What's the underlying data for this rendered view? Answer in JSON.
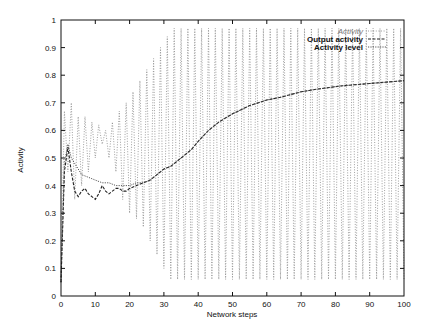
{
  "chart_data": {
    "type": "line",
    "title": "",
    "xlabel": "Network steps",
    "ylabel": "Activity",
    "xlim": [
      0,
      100
    ],
    "ylim": [
      0,
      1
    ],
    "grid": false,
    "legend_position": "upper right (inside)",
    "x_ticks": [
      0,
      10,
      20,
      30,
      40,
      50,
      60,
      70,
      80,
      90,
      100
    ],
    "y_ticks": [
      0,
      0.1,
      0.2,
      0.3,
      0.4,
      0.5,
      0.6,
      0.7,
      0.8,
      0.9,
      1
    ],
    "x_tick_labels": [
      "0",
      "10",
      "20",
      "30",
      "40",
      "50",
      "60",
      "70",
      "80",
      "90",
      "100"
    ],
    "y_tick_labels": [
      "0",
      "0.1",
      "0.2",
      "0.3",
      "0.4",
      "0.5",
      "0.6",
      "0.7",
      "0.8",
      "0.9",
      "1"
    ],
    "series": [
      {
        "name": "Activity",
        "style": "fine dotted, oscillating each step",
        "color": "#888888",
        "x": [
          0,
          1,
          2,
          3,
          4,
          5,
          6,
          7,
          8,
          9,
          10,
          11,
          12,
          13,
          14,
          15,
          16,
          17,
          18,
          19,
          20,
          21,
          22,
          23,
          24,
          25,
          26,
          27,
          28,
          29,
          30,
          31,
          32,
          33,
          34,
          35,
          36,
          37,
          38,
          39,
          40,
          41,
          42,
          43,
          44,
          45,
          46,
          47,
          48,
          49,
          50,
          51,
          52,
          53,
          54,
          55,
          56,
          57,
          58,
          59,
          60,
          61,
          62,
          63,
          64,
          65,
          66,
          67,
          68,
          69,
          70,
          71,
          72,
          73,
          74,
          75,
          76,
          77,
          78,
          79,
          80,
          81,
          82,
          83,
          84,
          85,
          86,
          87,
          88,
          89,
          90,
          91,
          92,
          93,
          94,
          95,
          96,
          97,
          98,
          99,
          100
        ],
        "values": [
          0.05,
          0.67,
          0.45,
          0.7,
          0.35,
          0.65,
          0.4,
          0.65,
          0.45,
          0.63,
          0.5,
          0.62,
          0.55,
          0.6,
          0.5,
          0.63,
          0.45,
          0.67,
          0.35,
          0.7,
          0.3,
          0.74,
          0.28,
          0.78,
          0.25,
          0.82,
          0.2,
          0.86,
          0.15,
          0.9,
          0.1,
          0.94,
          0.06,
          0.97,
          0.06,
          0.97,
          0.06,
          0.97,
          0.06,
          0.97,
          0.06,
          0.97,
          0.06,
          0.97,
          0.06,
          0.97,
          0.06,
          0.97,
          0.06,
          0.97,
          0.06,
          0.97,
          0.06,
          0.97,
          0.06,
          0.97,
          0.06,
          0.97,
          0.06,
          0.97,
          0.06,
          0.97,
          0.06,
          0.97,
          0.06,
          0.97,
          0.06,
          0.97,
          0.06,
          0.97,
          0.06,
          0.97,
          0.06,
          0.97,
          0.06,
          0.97,
          0.06,
          0.97,
          0.06,
          0.97,
          0.06,
          0.97,
          0.06,
          0.97,
          0.06,
          0.97,
          0.06,
          0.97,
          0.06,
          0.97,
          0.06,
          0.97,
          0.06,
          0.97,
          0.06,
          0.97,
          0.06,
          0.97,
          0.06,
          0.97,
          0.06
        ]
      },
      {
        "name": "Output activity",
        "style": "dashed",
        "color": "#222222",
        "x": [
          0,
          1,
          2,
          3,
          4,
          5,
          6,
          7,
          8,
          9,
          10,
          11,
          12,
          13,
          14,
          15,
          16,
          17,
          18,
          19,
          20,
          22,
          24,
          26,
          28,
          30,
          32,
          34,
          36,
          38,
          40,
          43,
          46,
          50,
          55,
          60,
          64,
          70,
          75,
          81,
          85,
          90,
          95,
          100
        ],
        "values": [
          0.05,
          0.45,
          0.54,
          0.45,
          0.38,
          0.36,
          0.38,
          0.39,
          0.37,
          0.36,
          0.35,
          0.37,
          0.4,
          0.38,
          0.37,
          0.38,
          0.39,
          0.39,
          0.38,
          0.38,
          0.39,
          0.4,
          0.41,
          0.42,
          0.44,
          0.46,
          0.47,
          0.49,
          0.51,
          0.53,
          0.56,
          0.6,
          0.63,
          0.66,
          0.69,
          0.71,
          0.72,
          0.74,
          0.75,
          0.76,
          0.765,
          0.77,
          0.775,
          0.78
        ]
      },
      {
        "name": "Activity level",
        "style": "dotted",
        "color": "#444444",
        "x": [
          0,
          1,
          2,
          3,
          4,
          5,
          6,
          8,
          10,
          12,
          14,
          16,
          18,
          20,
          22,
          24,
          26,
          28,
          30,
          32,
          34,
          36,
          38,
          40,
          43,
          46,
          50,
          55,
          60,
          64,
          70,
          75,
          81,
          85,
          90,
          95,
          100
        ],
        "values": [
          0.05,
          0.48,
          0.55,
          0.5,
          0.48,
          0.46,
          0.44,
          0.43,
          0.42,
          0.41,
          0.41,
          0.4,
          0.4,
          0.4,
          0.41,
          0.41,
          0.42,
          0.44,
          0.46,
          0.47,
          0.49,
          0.51,
          0.53,
          0.56,
          0.6,
          0.63,
          0.66,
          0.69,
          0.71,
          0.72,
          0.74,
          0.75,
          0.76,
          0.765,
          0.77,
          0.775,
          0.78
        ]
      }
    ]
  }
}
